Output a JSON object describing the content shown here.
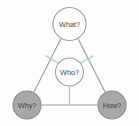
{
  "diagram": {
    "type": "triangle-framework",
    "background_color": "#fdfdfd",
    "edge_color": "#9a9a9a",
    "spoke_color": "#9ecbe4",
    "nodes": [
      {
        "id": "what",
        "label": "What?",
        "position": "top",
        "cx": 69.5,
        "cy": 24,
        "r": 17,
        "fill": "#ffffff",
        "stroke": "#a0a0a0",
        "text_color": "#4a4a4a"
      },
      {
        "id": "who",
        "label": "Who?",
        "position": "center",
        "cx": 69.5,
        "cy": 72,
        "r": 14.5,
        "fill": "#ffffff",
        "stroke": "#a0a0a0",
        "text_color": "#4a4a4a"
      },
      {
        "id": "why",
        "label": "Why?",
        "position": "bottom-left",
        "cx": 27,
        "cy": 105,
        "r": 14.5,
        "fill": "#a8a8a8",
        "stroke": "#8a8a8a",
        "text_color": "#3f3f3f"
      },
      {
        "id": "how",
        "label": "How?",
        "position": "bottom-right",
        "cx": 112,
        "cy": 105,
        "r": 14.5,
        "fill": "#a8a8a8",
        "stroke": "#8a8a8a",
        "text_color": "#3f3f3f"
      }
    ],
    "edges": [
      {
        "id": "edge-what-why",
        "from": "what",
        "to": "why",
        "color": "#9a9a9a"
      },
      {
        "id": "edge-what-how",
        "from": "what",
        "to": "how",
        "color": "#9a9a9a"
      },
      {
        "id": "edge-why-how",
        "from": "why",
        "to": "how",
        "color": "#9a9a9a"
      }
    ],
    "spokes": [
      {
        "id": "spoke-who-what-left",
        "from": "who",
        "to": "edge-what-why",
        "color": "#9ecbe4"
      },
      {
        "id": "spoke-who-what-right",
        "from": "who",
        "to": "edge-what-how",
        "color": "#9ecbe4"
      },
      {
        "id": "spoke-who-bottom",
        "from": "who",
        "to": "edge-why-how",
        "color": "#9ecbe4"
      }
    ]
  }
}
